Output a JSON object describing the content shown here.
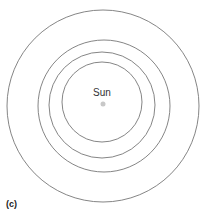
{
  "diagram": {
    "center_label": "Sun",
    "panel_label": "(c)",
    "sun": {
      "cx": 103,
      "cy": 104,
      "r": 2.5,
      "color": "#c8c8c8"
    },
    "orbits": [
      {
        "cx": 102,
        "cy": 102,
        "r": 40
      },
      {
        "cx": 102,
        "cy": 105,
        "r": 53
      },
      {
        "cx": 104,
        "cy": 106,
        "r": 66
      },
      {
        "cx": 103,
        "cy": 106,
        "r": 96
      }
    ],
    "orbit_color": "#777777"
  }
}
